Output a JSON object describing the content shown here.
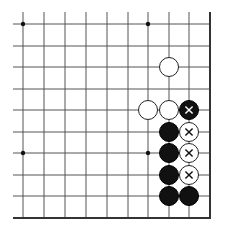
{
  "board": {
    "grid": {
      "columns_x": [
        23,
        44,
        65,
        86,
        107,
        128,
        148,
        169,
        189,
        210
      ],
      "rows_y": [
        24,
        46,
        67,
        89,
        110,
        132,
        153,
        175,
        196,
        218
      ],
      "open_left_x": 13,
      "open_top_y": 12,
      "right_edge_x": 210,
      "bottom_edge_y": 218,
      "line_color": "#555555",
      "edge_color": "#333333"
    },
    "star_points": [
      {
        "col": 0,
        "row": 0
      },
      {
        "col": 6,
        "row": 0
      },
      {
        "col": 0,
        "row": 6
      },
      {
        "col": 6,
        "row": 6
      }
    ],
    "stone_diameter": 20,
    "stones": [
      {
        "color": "white",
        "col": 7,
        "row": 2,
        "mark": ""
      },
      {
        "color": "white",
        "col": 6,
        "row": 4,
        "mark": ""
      },
      {
        "color": "white",
        "col": 7,
        "row": 4,
        "mark": ""
      },
      {
        "color": "black",
        "col": 8,
        "row": 4,
        "mark": "x"
      },
      {
        "color": "black",
        "col": 7,
        "row": 5,
        "mark": ""
      },
      {
        "color": "white",
        "col": 8,
        "row": 5,
        "mark": "x"
      },
      {
        "color": "black",
        "col": 7,
        "row": 6,
        "mark": ""
      },
      {
        "color": "white",
        "col": 8,
        "row": 6,
        "mark": "x"
      },
      {
        "color": "black",
        "col": 7,
        "row": 7,
        "mark": ""
      },
      {
        "color": "white",
        "col": 8,
        "row": 7,
        "mark": "x"
      },
      {
        "color": "black",
        "col": 7,
        "row": 8,
        "mark": ""
      },
      {
        "color": "black",
        "col": 8,
        "row": 8,
        "mark": ""
      }
    ]
  }
}
